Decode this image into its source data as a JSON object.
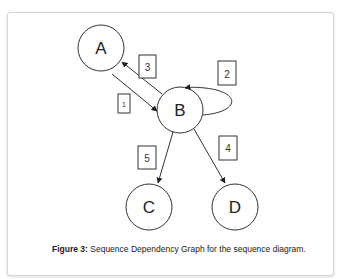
{
  "figure": {
    "caption_label": "Figure 3:",
    "caption_text": " Sequence Dependency Graph for the sequence diagram."
  },
  "graph": {
    "nodes": [
      {
        "id": "A",
        "label": "A"
      },
      {
        "id": "B",
        "label": "B"
      },
      {
        "id": "C",
        "label": "C"
      },
      {
        "id": "D",
        "label": "D"
      }
    ],
    "edges": [
      {
        "from": "A",
        "to": "B",
        "label": "1"
      },
      {
        "from": "B",
        "to": "B",
        "label": "2"
      },
      {
        "from": "B",
        "to": "A",
        "label": "3"
      },
      {
        "from": "B",
        "to": "D",
        "label": "4"
      },
      {
        "from": "B",
        "to": "C",
        "label": "5"
      }
    ]
  }
}
